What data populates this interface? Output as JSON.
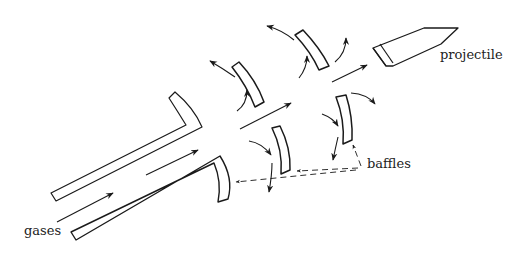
{
  "diagram": {
    "labels": {
      "gases": "gases",
      "projectile": "projectile",
      "baffles": "baffles"
    },
    "colors": {
      "stroke": "#1a1a1a",
      "background": "#ffffff"
    }
  }
}
